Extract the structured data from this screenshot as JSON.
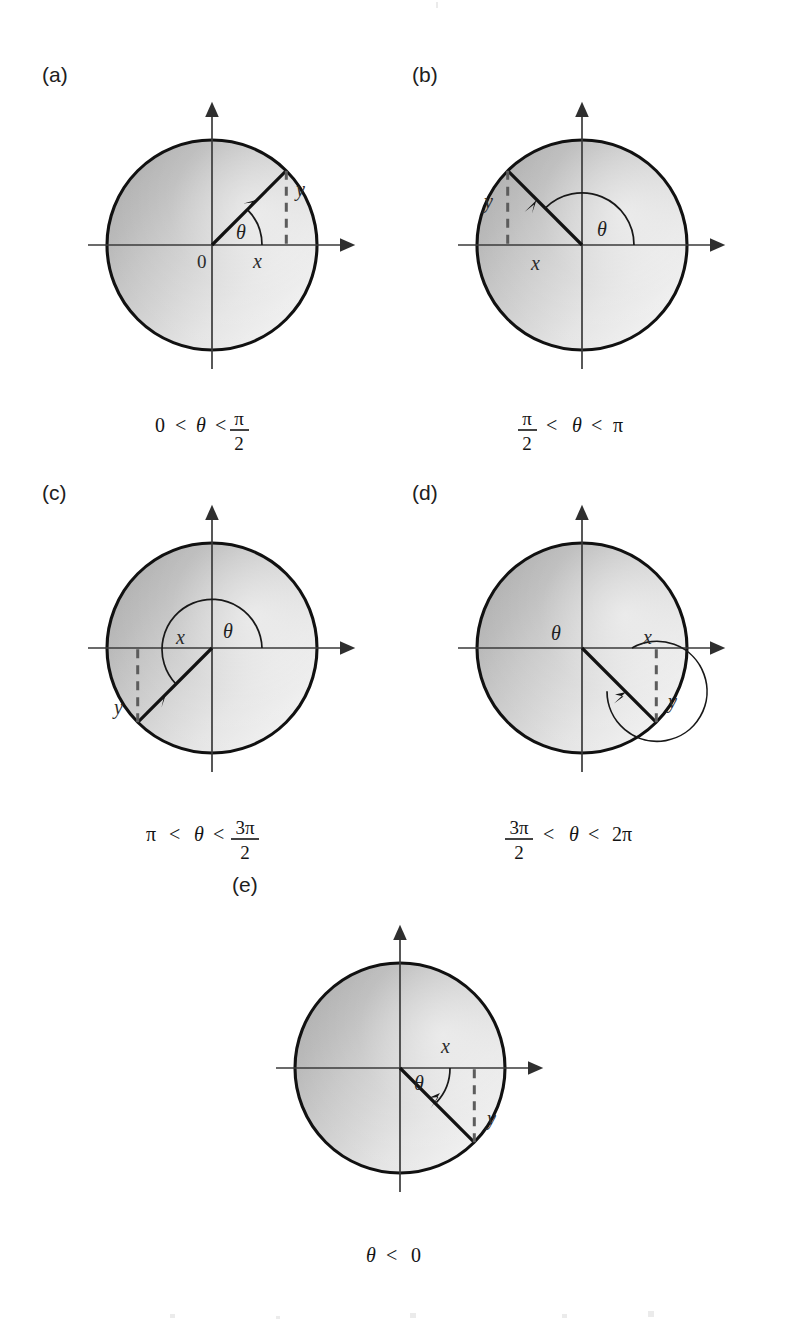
{
  "figure": {
    "panels": [
      {
        "id": "a",
        "label": "(a)",
        "caption": {
          "left": "0",
          "rel1": "<",
          "theta": "θ",
          "rel2": "<",
          "right_numerator": "π",
          "right_denominator": "2",
          "right_is_fraction": true,
          "plain": "0 < θ < π/2"
        },
        "quadrant": 1,
        "angle_deg": 45,
        "arc_sweep_deg": 45,
        "arc_direction": "counterclockwise",
        "x_label": "x",
        "y_label": "y",
        "theta_label": "θ",
        "origin_label": "0",
        "show_origin_label": true
      },
      {
        "id": "b",
        "label": "(b)",
        "caption": {
          "left_numerator": "π",
          "left_denominator": "2",
          "left_is_fraction": true,
          "rel1": "<",
          "theta": "θ",
          "rel2": "<",
          "right": "π",
          "plain": "π/2 < θ < π"
        },
        "quadrant": 2,
        "angle_deg": 135,
        "arc_sweep_deg": 135,
        "arc_direction": "counterclockwise",
        "x_label": "x",
        "y_label": "y",
        "theta_label": "θ",
        "show_origin_label": false
      },
      {
        "id": "c",
        "label": "(c)",
        "caption": {
          "left": "π",
          "rel1": "<",
          "theta": "θ",
          "rel2": "<",
          "right_numerator": "3π",
          "right_denominator": "2",
          "right_is_fraction": true,
          "plain": "π < θ < 3π/2"
        },
        "quadrant": 3,
        "angle_deg": 225,
        "arc_sweep_deg": 225,
        "arc_direction": "counterclockwise",
        "x_label": "x",
        "y_label": "y",
        "theta_label": "θ",
        "show_origin_label": false
      },
      {
        "id": "d",
        "label": "(d)",
        "caption": {
          "left_numerator": "3π",
          "left_denominator": "2",
          "left_is_fraction": true,
          "rel1": "<",
          "theta": "θ",
          "rel2": "<",
          "right": "2π",
          "plain": "3π/2 < θ < 2π"
        },
        "quadrant": 4,
        "angle_deg": 315,
        "arc_sweep_deg": 315,
        "arc_direction": "counterclockwise",
        "x_label": "x",
        "y_label": "y",
        "theta_label": "θ",
        "show_origin_label": false
      },
      {
        "id": "e",
        "label": "(e)",
        "caption": {
          "theta": "θ",
          "rel1": "<",
          "right": "0",
          "plain": "θ < 0"
        },
        "quadrant": 4,
        "angle_deg": -45,
        "arc_sweep_deg": -45,
        "arc_direction": "clockwise",
        "x_label": "x",
        "y_label": "y",
        "theta_label": "θ",
        "show_origin_label": false
      }
    ],
    "symbols": {
      "theta": "θ",
      "pi": "π",
      "less_than": "<"
    },
    "colors": {
      "outline": "#111111",
      "axis": "#3a3a3a",
      "radius": "#121212",
      "dashed": "#5c5c5c",
      "text": "#141414",
      "fill_dark": "#b4b4b4",
      "fill_light": "#efefef"
    }
  }
}
